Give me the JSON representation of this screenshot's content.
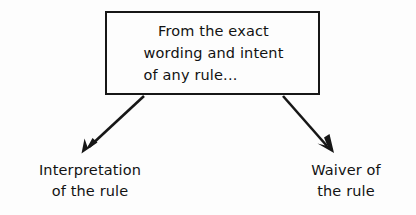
{
  "diagram": {
    "background_color": "#fdfdfd",
    "ink_color": "#171717",
    "source_box": {
      "name": "source-statement-box",
      "lines": [
        "From the exact",
        "wording and intent",
        "of any rule..."
      ]
    },
    "outcomes": [
      {
        "name": "interpretation",
        "lines": [
          "Interpretation",
          "of the rule"
        ]
      },
      {
        "name": "waiver",
        "lines": [
          "Waiver of",
          "the rule"
        ]
      }
    ],
    "connectors": [
      {
        "name": "arrow-to-interpretation",
        "direction": "down-left",
        "from": "source-box-bottom-left",
        "to": "interpretation-label"
      },
      {
        "name": "arrow-to-waiver",
        "direction": "down-right",
        "from": "source-box-bottom-right",
        "to": "waiver-label"
      }
    ]
  }
}
